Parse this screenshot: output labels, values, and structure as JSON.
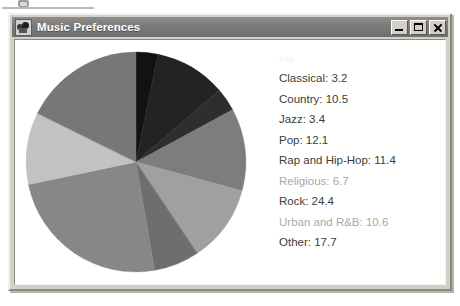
{
  "window": {
    "title": "Music Preferences",
    "icon": "music-note-icon",
    "buttons": {
      "minimize": "Minimize",
      "maximize": "Maximize",
      "close": "Close"
    }
  },
  "legend": {
    "heading": "Key",
    "entries": [
      {
        "label": "Classical: 3.2",
        "name": "classical",
        "dim": false
      },
      {
        "label": "Country: 10.5",
        "name": "country",
        "dim": false
      },
      {
        "label": "Jazz: 3.4",
        "name": "jazz",
        "dim": false
      },
      {
        "label": "Pop: 12.1",
        "name": "pop",
        "dim": false
      },
      {
        "label": "Rap and Hip-Hop: 11.4",
        "name": "rap-hip-hop",
        "dim": false
      },
      {
        "label": "Religious: 6.7",
        "name": "religious",
        "dim": true
      },
      {
        "label": "Rock: 24.4",
        "name": "rock",
        "dim": false
      },
      {
        "label": "Urban and R&B: 10.6",
        "name": "urban-rnb",
        "dim": true
      },
      {
        "label": "Other: 17.7",
        "name": "other",
        "dim": false
      }
    ]
  },
  "chart_data": {
    "type": "pie",
    "title": "Music Preferences",
    "xlabel": "",
    "ylabel": "",
    "legend_position": "right",
    "grid": false,
    "start_angle_deg": -90,
    "direction": "clockwise",
    "units": "percent",
    "categories": [
      "Classical",
      "Country",
      "Jazz",
      "Pop",
      "Rap and Hip-Hop",
      "Religious",
      "Rock",
      "Urban and R&B",
      "Other"
    ],
    "values": [
      3.2,
      10.5,
      3.4,
      12.1,
      11.4,
      6.7,
      24.4,
      10.6,
      17.7
    ],
    "colors": [
      "#121212",
      "#232323",
      "#2e2e2e",
      "#7d7d7d",
      "#a0a0a0",
      "#6e6e6e",
      "#878787",
      "#c2c2c2",
      "#777777"
    ]
  }
}
